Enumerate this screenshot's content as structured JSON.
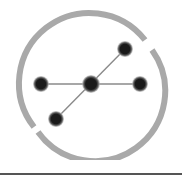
{
  "logo": {
    "icon": "network-graph-icon",
    "colors": {
      "ring": "#a8a8a8",
      "node_fill": "#1a1a1a",
      "node_halo": "#9a9a9a",
      "edge": "#8a8a8a",
      "divider": "#555555"
    },
    "nodes": [
      {
        "name": "center",
        "x": 91,
        "y": 84
      },
      {
        "name": "left",
        "x": 41,
        "y": 84
      },
      {
        "name": "right",
        "x": 140,
        "y": 84
      },
      {
        "name": "top-right",
        "x": 125,
        "y": 49
      },
      {
        "name": "bottom-left",
        "x": 56,
        "y": 119
      }
    ]
  }
}
